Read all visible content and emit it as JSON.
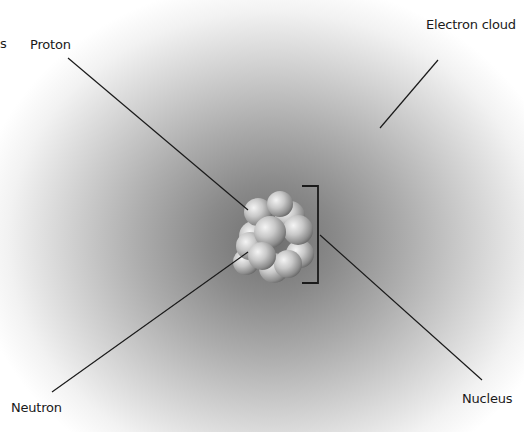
{
  "diagram": {
    "labels": {
      "proton": "Proton",
      "electron_cloud": "Electron cloud",
      "neutron": "Neutron",
      "nucleus": "Nucleus",
      "cut_off_char": "s"
    },
    "colors": {
      "cloud_center": "#6e6e6e",
      "cloud_edge": "#ffffff",
      "leader_line": "#1a1a1a",
      "particle": "#bdbdbd"
    }
  }
}
